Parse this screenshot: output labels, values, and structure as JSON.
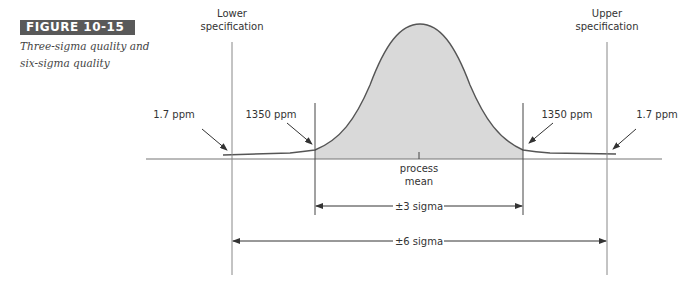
{
  "figure": {
    "label": "FIGURE 10-15",
    "caption": "Three-sigma quality and six-sigma quality"
  },
  "diagram": {
    "lower_spec_label_line1": "Lower",
    "lower_spec_label_line2": "specification",
    "upper_spec_label_line1": "Upper",
    "upper_spec_label_line2": "specification",
    "left_outer_ppm": "1.7 ppm",
    "left_inner_ppm": "1350 ppm",
    "right_inner_ppm": "1350 ppm",
    "right_outer_ppm": "1.7 ppm",
    "mean_label_line1": "process",
    "mean_label_line2": "mean",
    "three_sigma_label": "±3 sigma",
    "six_sigma_label": "±6 sigma",
    "colors": {
      "fill": "#d9d9d9",
      "line": "#555555",
      "badge": "#595959"
    }
  }
}
